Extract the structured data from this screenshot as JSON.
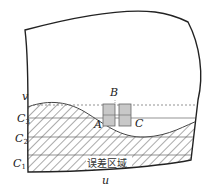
{
  "diagram": {
    "labels": {
      "v": "v",
      "u": "u",
      "B": "B",
      "A": "A",
      "C": "C",
      "C3": "C",
      "C3_sub": "3",
      "C2": "C",
      "C2_sub": "2",
      "C1": "C",
      "C1_sub": "1",
      "error_region": "误差区域"
    },
    "colors": {
      "outline": "#222222",
      "hatch": "#555555",
      "box_fill": "#c8c8c8",
      "box_stroke": "#666666"
    }
  }
}
